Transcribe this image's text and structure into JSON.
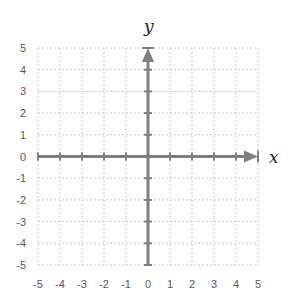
{
  "chart_data": {
    "type": "scatter",
    "title": "",
    "xlabel": "x",
    "ylabel": "y",
    "xlim": [
      -5,
      5
    ],
    "ylim": [
      -5,
      5
    ],
    "x_ticks": [
      "-5",
      "-4",
      "-3",
      "-2",
      "-1",
      "0",
      "1",
      "2",
      "3",
      "4",
      "5"
    ],
    "y_ticks": [
      "5",
      "4",
      "3",
      "2",
      "1",
      "0",
      "-1",
      "-2",
      "-3",
      "-4",
      "-5"
    ],
    "grid": true,
    "grid_style": "dashed",
    "series": [],
    "legend": null
  },
  "colors": {
    "axis": "#7f7f7f",
    "grid": "#c8c8c8",
    "labels": "#595959"
  },
  "axes": {
    "x_title": "x",
    "y_title": "y"
  }
}
